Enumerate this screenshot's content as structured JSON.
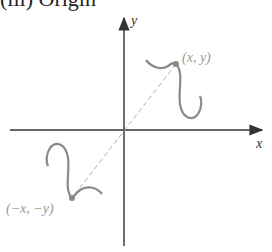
{
  "figure": {
    "title": "(iii) Origin",
    "axes": {
      "x_label": "x",
      "y_label": "y"
    },
    "points": [
      {
        "label": "(x, y)",
        "role": "original point"
      },
      {
        "label": "(−x, −y)",
        "role": "reflected point"
      }
    ],
    "colors": {
      "axis": "#333333",
      "curve": "#8a8a8a",
      "dash": "#b0b0b0",
      "label": "#999999"
    }
  }
}
